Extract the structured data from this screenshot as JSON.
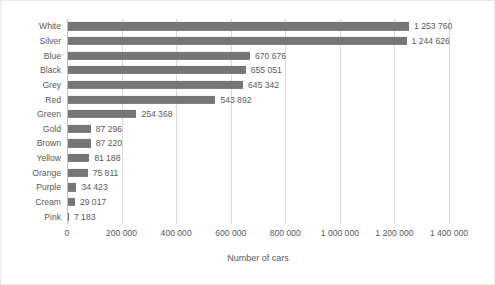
{
  "chart_data": {
    "type": "bar",
    "orientation": "horizontal",
    "title": "",
    "xlabel": "Number of cars",
    "ylabel": "",
    "xlim": [
      0,
      1400000
    ],
    "xticks": [
      "0",
      "200 000",
      "400 000",
      "600 000",
      "800 000",
      "1 000 000",
      "1 200 000",
      "1 400 000"
    ],
    "xtick_values": [
      0,
      200000,
      400000,
      600000,
      800000,
      1000000,
      1200000,
      1400000
    ],
    "grid": "vertical",
    "legend": "none",
    "bar_color": "#767676",
    "categories": [
      "White",
      "Silver",
      "Blue",
      "Black",
      "Grey",
      "Red",
      "Green",
      "Gold",
      "Brown",
      "Yellow",
      "Orange",
      "Purple",
      "Cream",
      "Pink"
    ],
    "values": [
      1253760,
      1244626,
      670676,
      655051,
      645342,
      543892,
      254368,
      87296,
      87220,
      81188,
      75811,
      34423,
      29017,
      7183
    ],
    "value_labels": [
      "1 253 760",
      "1 244 626",
      "670 676",
      "655 051",
      "645 342",
      "543 892",
      "254 368",
      "87 296",
      "87 220",
      "81 188",
      "75 811",
      "34 423",
      "29 017",
      "7 183"
    ]
  }
}
